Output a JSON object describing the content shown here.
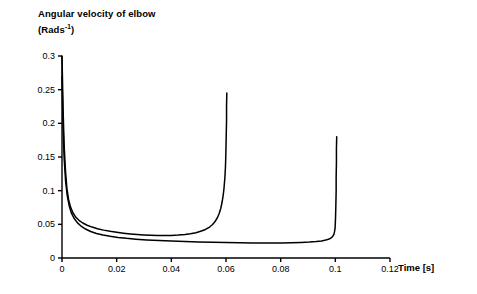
{
  "chart_data": {
    "type": "line",
    "title_line1": "Angular velocity of elbow",
    "title_line2_prefix": "(Rads",
    "title_line2_sup": "-1",
    "title_line2_suffix": ")",
    "xlabel": "Time [s]",
    "ylabel": "",
    "xlim": [
      0,
      0.12
    ],
    "ylim": [
      0,
      0.3
    ],
    "xticks": [
      0,
      0.02,
      0.04,
      0.06,
      0.08,
      0.1,
      0.12
    ],
    "xticklabels": [
      "0",
      "0.02",
      "0.04",
      "0.06",
      "0.08",
      "0.1",
      "0.12"
    ],
    "yticks": [
      0,
      0.05,
      0.1,
      0.15,
      0.2,
      0.25,
      0.3
    ],
    "yticklabels": [
      "0",
      "0.05",
      "0.1",
      "0.15",
      "0.2",
      "0.25",
      "0.3"
    ],
    "grid": false,
    "legend": "none",
    "line_color": "#000000",
    "background_color": "#ffffff",
    "series": [
      {
        "name": "curve-1",
        "color": "#000000",
        "points": [
          [
            0.0,
            0.3
          ],
          [
            0.0004,
            0.22
          ],
          [
            0.0008,
            0.165
          ],
          [
            0.0013,
            0.128
          ],
          [
            0.0018,
            0.103
          ],
          [
            0.0024,
            0.087
          ],
          [
            0.0031,
            0.076
          ],
          [
            0.004,
            0.0672
          ],
          [
            0.005,
            0.0608
          ],
          [
            0.0062,
            0.056
          ],
          [
            0.0076,
            0.052
          ],
          [
            0.0092,
            0.0487
          ],
          [
            0.011,
            0.0459
          ],
          [
            0.013,
            0.0435
          ],
          [
            0.0152,
            0.0414
          ],
          [
            0.0176,
            0.0396
          ],
          [
            0.02,
            0.0382
          ],
          [
            0.0225,
            0.0369
          ],
          [
            0.025,
            0.0358
          ],
          [
            0.0275,
            0.0349
          ],
          [
            0.03,
            0.0342
          ],
          [
            0.0325,
            0.0337
          ],
          [
            0.035,
            0.0334
          ],
          [
            0.0375,
            0.0333
          ],
          [
            0.04,
            0.0335
          ],
          [
            0.0425,
            0.034
          ],
          [
            0.045,
            0.0349
          ],
          [
            0.047,
            0.036
          ],
          [
            0.049,
            0.0376
          ],
          [
            0.051,
            0.04
          ],
          [
            0.0525,
            0.0424
          ],
          [
            0.054,
            0.046
          ],
          [
            0.055,
            0.0494
          ],
          [
            0.056,
            0.0542
          ],
          [
            0.0568,
            0.0595
          ],
          [
            0.0575,
            0.066
          ],
          [
            0.0581,
            0.074
          ],
          [
            0.0586,
            0.0835
          ],
          [
            0.059,
            0.094
          ],
          [
            0.0593,
            0.105
          ],
          [
            0.0596,
            0.12
          ],
          [
            0.0598,
            0.135
          ],
          [
            0.0599,
            0.148
          ],
          [
            0.06,
            0.165
          ],
          [
            0.0601,
            0.185
          ],
          [
            0.0602,
            0.205
          ],
          [
            0.0602,
            0.225
          ],
          [
            0.0603,
            0.245
          ]
        ]
      },
      {
        "name": "curve-2",
        "color": "#000000",
        "points": [
          [
            0.0,
            0.27
          ],
          [
            0.0004,
            0.195
          ],
          [
            0.0008,
            0.147
          ],
          [
            0.0013,
            0.115
          ],
          [
            0.0019,
            0.093
          ],
          [
            0.0026,
            0.078
          ],
          [
            0.0034,
            0.067
          ],
          [
            0.0044,
            0.059
          ],
          [
            0.0056,
            0.0525
          ],
          [
            0.007,
            0.0472
          ],
          [
            0.0086,
            0.043
          ],
          [
            0.0105,
            0.0394
          ],
          [
            0.0126,
            0.0365
          ],
          [
            0.015,
            0.0341
          ],
          [
            0.0176,
            0.0322
          ],
          [
            0.0205,
            0.0306
          ],
          [
            0.0236,
            0.0292
          ],
          [
            0.027,
            0.028
          ],
          [
            0.031,
            0.0269
          ],
          [
            0.0355,
            0.0259
          ],
          [
            0.04,
            0.0251
          ],
          [
            0.045,
            0.0244
          ],
          [
            0.05,
            0.0238
          ],
          [
            0.055,
            0.0233
          ],
          [
            0.06,
            0.0229
          ],
          [
            0.065,
            0.0226
          ],
          [
            0.07,
            0.0224
          ],
          [
            0.075,
            0.0223
          ],
          [
            0.08,
            0.0224
          ],
          [
            0.084,
            0.0226
          ],
          [
            0.0875,
            0.023
          ],
          [
            0.0905,
            0.0236
          ],
          [
            0.093,
            0.0244
          ],
          [
            0.095,
            0.0254
          ],
          [
            0.0965,
            0.0266
          ],
          [
            0.0975,
            0.0278
          ],
          [
            0.0982,
            0.0292
          ],
          [
            0.0988,
            0.031
          ],
          [
            0.0992,
            0.033
          ],
          [
            0.0995,
            0.0355
          ],
          [
            0.0997,
            0.039
          ],
          [
            0.0999,
            0.044
          ],
          [
            0.1,
            0.052
          ],
          [
            0.1001,
            0.064
          ],
          [
            0.1002,
            0.08
          ],
          [
            0.1003,
            0.099
          ],
          [
            0.1003,
            0.12
          ],
          [
            0.1004,
            0.142
          ],
          [
            0.1004,
            0.162
          ],
          [
            0.1005,
            0.18
          ]
        ]
      }
    ]
  },
  "axes_geometry": {
    "plot_left_px": 62,
    "plot_right_px": 390,
    "plot_top_px": 56,
    "plot_bottom_px": 258
  }
}
